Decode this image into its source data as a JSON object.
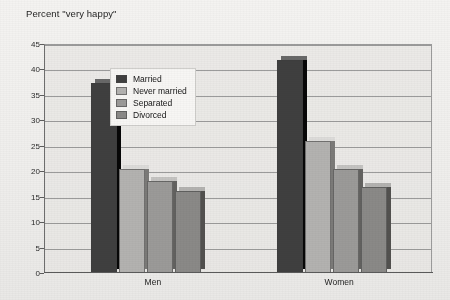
{
  "chart_data": {
    "type": "bar",
    "title": "Percent \"very happy\"",
    "xlabel": "",
    "ylabel": "",
    "ylim": [
      0,
      45
    ],
    "ytick_step": 5,
    "yticks": [
      "45",
      "40",
      "35",
      "30",
      "25",
      "20",
      "15",
      "10",
      "5",
      "0"
    ],
    "grid": true,
    "legend_position": "inside-top-left",
    "categories": [
      "Men",
      "Women"
    ],
    "series": [
      {
        "name": "Married",
        "color": "#3f3f3f",
        "values": [
          37.3,
          41.8
        ]
      },
      {
        "name": "Never married",
        "color": "#b3b2b0",
        "values": [
          20.5,
          25.9
        ]
      },
      {
        "name": "Separated",
        "color": "#9b9a98",
        "values": [
          18.1,
          20.5
        ]
      },
      {
        "name": "Divorced",
        "color": "#8a8987",
        "values": [
          16.1,
          17.0
        ]
      }
    ]
  },
  "figure": {
    "footnote": ""
  }
}
